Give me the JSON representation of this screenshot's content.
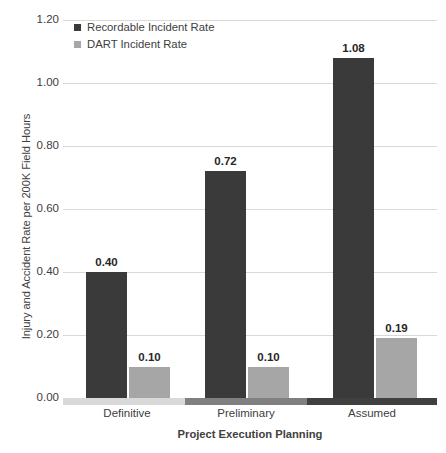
{
  "chart_data": {
    "type": "bar",
    "title": "",
    "xlabel": "Project Execution Planning",
    "ylabel": "Injury and Accident Rate per 200K Field Hours",
    "categories": [
      "Definitive",
      "Preliminary",
      "Assumed"
    ],
    "series": [
      {
        "name": "Recordable Incident Rate",
        "color": "#3a3a3a",
        "values": [
          0.4,
          0.72,
          1.08
        ],
        "labels": [
          "0.40",
          "0.72",
          "1.08"
        ]
      },
      {
        "name": "DART Incident Rate",
        "color": "#a6a6a6",
        "values": [
          0.1,
          0.1,
          0.19
        ],
        "labels": [
          "0.10",
          "0.10",
          "0.19"
        ]
      }
    ],
    "ylim": [
      0.0,
      1.2
    ],
    "ytick_values": [
      0.0,
      0.2,
      0.4,
      0.6,
      0.8,
      1.0,
      1.2
    ],
    "ytick_labels": [
      "0.00",
      "0.20",
      "0.40",
      "0.60",
      "0.80",
      "1.00",
      "1.20"
    ],
    "grid": true,
    "legend_position": "top-left",
    "axis_band_colors": [
      "#d9d9d9",
      "#808080",
      "#404040"
    ],
    "gridline_color": "#d9d9d9"
  }
}
